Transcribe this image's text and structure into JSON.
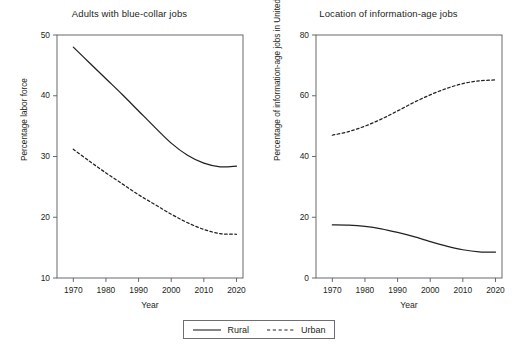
{
  "figure": {
    "legend": {
      "name": "series-legend",
      "entries": [
        {
          "label": "Rural",
          "style": "solid",
          "color": "#231f20"
        },
        {
          "label": "Urban",
          "style": "dashed",
          "color": "#231f20"
        }
      ]
    }
  },
  "chart_data": [
    {
      "type": "line",
      "panel": "left",
      "title": "Adults with blue-collar jobs",
      "xlabel": "Year",
      "ylabel": "Percentage labor force",
      "xlim": [
        1965,
        2022
      ],
      "ylim": [
        10,
        50
      ],
      "xticks": [
        1970,
        1980,
        1990,
        2000,
        2010,
        2020
      ],
      "yticks": [
        10,
        20,
        30,
        40,
        50
      ],
      "grid": false,
      "legend_position": "below-figure",
      "x": [
        1970,
        1975,
        1980,
        1985,
        1990,
        1995,
        2000,
        2005,
        2010,
        2015,
        2020
      ],
      "series": [
        {
          "name": "Rural",
          "style": "solid",
          "color": "#231f20",
          "values": [
            48.0,
            45.4,
            42.8,
            40.2,
            37.5,
            34.8,
            32.2,
            30.2,
            28.9,
            28.3,
            28.4
          ]
        },
        {
          "name": "Urban",
          "style": "dashed",
          "color": "#231f20",
          "values": [
            31.2,
            29.2,
            27.3,
            25.5,
            23.7,
            22.1,
            20.5,
            19.1,
            18.0,
            17.3,
            17.2
          ]
        }
      ]
    },
    {
      "type": "line",
      "panel": "right",
      "title": "Location of information-age jobs",
      "xlabel": "Year",
      "ylabel": "Percentage of information-age jobs in United States",
      "xlim": [
        1965,
        2022
      ],
      "ylim": [
        0,
        80
      ],
      "xticks": [
        1970,
        1980,
        1990,
        2000,
        2010,
        2020
      ],
      "yticks": [
        0,
        20,
        40,
        60,
        80
      ],
      "grid": false,
      "legend_position": "below-figure",
      "x": [
        1970,
        1975,
        1980,
        1985,
        1990,
        1995,
        2000,
        2005,
        2010,
        2015,
        2020
      ],
      "series": [
        {
          "name": "Urban",
          "style": "dashed",
          "color": "#231f20",
          "values": [
            47.0,
            48.2,
            50.0,
            52.3,
            55.0,
            57.8,
            60.3,
            62.4,
            64.0,
            64.9,
            65.2
          ]
        },
        {
          "name": "Rural",
          "style": "solid",
          "color": "#231f20",
          "values": [
            17.5,
            17.4,
            17.0,
            16.2,
            15.0,
            13.6,
            12.0,
            10.5,
            9.3,
            8.6,
            8.5
          ]
        }
      ]
    }
  ]
}
